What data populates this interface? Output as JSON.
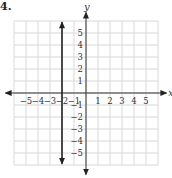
{
  "problem": {
    "number": "4."
  },
  "chart_data": {
    "type": "line",
    "title": "",
    "xlabel": "x",
    "ylabel": "y",
    "xlim": [
      -6,
      6
    ],
    "ylim": [
      -6,
      6
    ],
    "grid": true,
    "x_ticks": [
      "−5",
      "−4",
      "−3",
      "−2",
      "−1",
      "1",
      "2",
      "3",
      "4",
      "5"
    ],
    "y_ticks": [
      "5",
      "4",
      "3",
      "2",
      "1",
      "−1",
      "−2",
      "−3",
      "−4",
      "−5"
    ],
    "series": [
      {
        "name": "x = -2",
        "type": "vertical-line",
        "x": -2,
        "y_range": [
          -6,
          6
        ],
        "arrows": "both",
        "color": "#222222"
      }
    ]
  }
}
